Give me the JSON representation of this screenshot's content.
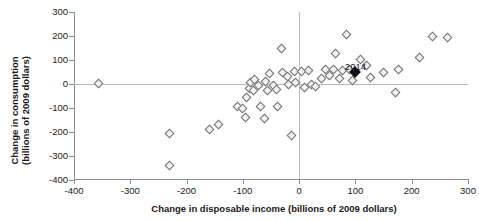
{
  "chart_data": {
    "type": "scatter",
    "title": "",
    "xlabel": "Change in disposable income (billions of 2009 dollars)",
    "ylabel_line1": "Change in consumption",
    "ylabel_line2": "(billions of 2009 dollars)",
    "xlim": [
      -400,
      300
    ],
    "ylim": [
      -400,
      300
    ],
    "xticks": [
      -400,
      -300,
      -200,
      -100,
      0,
      100,
      200,
      300
    ],
    "yticks": [
      -400,
      -300,
      -200,
      -100,
      0,
      100,
      200,
      300
    ],
    "xticklabels": [
      "-400",
      "-300",
      "-200",
      "-100",
      "0",
      "100",
      "200",
      "300"
    ],
    "yticklabels": [
      "-400",
      "-300",
      "-200",
      "-100",
      "0",
      "100",
      "200",
      "300"
    ],
    "grid": false,
    "reference_lines": {
      "x": 0,
      "y": 0
    },
    "marker": "open-diamond",
    "marker_color": "#f2f2f2",
    "marker_edge_color": "#6e6e6e",
    "highlight_marker": "filled-diamond",
    "highlight_color": "#121212",
    "annotations": [
      {
        "text": "2014",
        "x": 100,
        "y": 75
      }
    ],
    "points": [
      {
        "x": -355,
        "y": 0
      },
      {
        "x": -230,
        "y": -210
      },
      {
        "x": -230,
        "y": -340
      },
      {
        "x": -158,
        "y": -193
      },
      {
        "x": -143,
        "y": -170
      },
      {
        "x": -108,
        "y": -95
      },
      {
        "x": -100,
        "y": -105
      },
      {
        "x": -95,
        "y": -140
      },
      {
        "x": -92,
        "y": -60
      },
      {
        "x": -88,
        "y": -20
      },
      {
        "x": -85,
        "y": 5
      },
      {
        "x": -80,
        "y": -30
      },
      {
        "x": -78,
        "y": 15
      },
      {
        "x": -72,
        "y": -8
      },
      {
        "x": -68,
        "y": -95
      },
      {
        "x": -60,
        "y": -145
      },
      {
        "x": -58,
        "y": 10
      },
      {
        "x": -55,
        "y": -30
      },
      {
        "x": -52,
        "y": 40
      },
      {
        "x": -45,
        "y": -10
      },
      {
        "x": -40,
        "y": -25
      },
      {
        "x": -38,
        "y": -95
      },
      {
        "x": -30,
        "y": 145
      },
      {
        "x": -28,
        "y": 45
      },
      {
        "x": -20,
        "y": 30
      },
      {
        "x": -18,
        "y": -5
      },
      {
        "x": -12,
        "y": -215
      },
      {
        "x": -8,
        "y": 50
      },
      {
        "x": -5,
        "y": 5
      },
      {
        "x": 5,
        "y": 48
      },
      {
        "x": 10,
        "y": -15
      },
      {
        "x": 18,
        "y": 55
      },
      {
        "x": 22,
        "y": -5
      },
      {
        "x": 30,
        "y": -12
      },
      {
        "x": 40,
        "y": 20
      },
      {
        "x": 48,
        "y": 60
      },
      {
        "x": 55,
        "y": 35
      },
      {
        "x": 62,
        "y": 60
      },
      {
        "x": 65,
        "y": 125
      },
      {
        "x": 72,
        "y": 20
      },
      {
        "x": 78,
        "y": 55
      },
      {
        "x": 85,
        "y": 205
      },
      {
        "x": 90,
        "y": 60
      },
      {
        "x": 95,
        "y": 12
      },
      {
        "x": 110,
        "y": 100
      },
      {
        "x": 120,
        "y": 75
      },
      {
        "x": 128,
        "y": 25
      },
      {
        "x": 150,
        "y": 45
      },
      {
        "x": 172,
        "y": -38
      },
      {
        "x": 178,
        "y": 60
      },
      {
        "x": 215,
        "y": 110
      },
      {
        "x": 237,
        "y": 195
      },
      {
        "x": 265,
        "y": 190
      }
    ],
    "highlight_point": {
      "x": 100,
      "y": 48,
      "label": "2014"
    }
  }
}
